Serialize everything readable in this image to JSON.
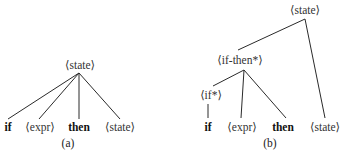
{
  "tree_a": {
    "caption": "(a)",
    "root": "⟨state⟩",
    "leaves": [
      {
        "text": "if",
        "kind": "keyword"
      },
      {
        "text": "⟨expr⟩",
        "kind": "nonterminal"
      },
      {
        "text": "then",
        "kind": "keyword"
      },
      {
        "text": "⟨state⟩",
        "kind": "nonterminal"
      }
    ]
  },
  "tree_b": {
    "caption": "(b)",
    "root": "⟨state⟩",
    "if_then_node": "⟨if-then*⟩",
    "if_node": "⟨if*⟩",
    "leaves": [
      {
        "text": "if",
        "kind": "keyword"
      },
      {
        "text": "⟨expr⟩",
        "kind": "nonterminal"
      },
      {
        "text": "then",
        "kind": "keyword"
      },
      {
        "text": "⟨state⟩",
        "kind": "nonterminal"
      }
    ]
  },
  "colors": {
    "line": "#2a2a2a",
    "text": "#1a1a1a",
    "background": "#ffffff"
  }
}
